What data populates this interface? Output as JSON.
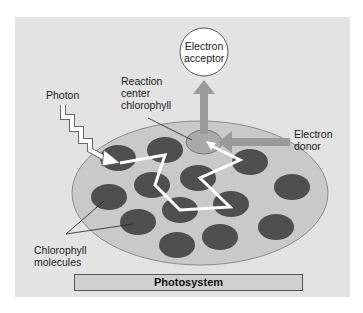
{
  "diagram": {
    "title": "Photosystem",
    "labels": {
      "electron_acceptor": [
        "Electron",
        "acceptor"
      ],
      "reaction_center": [
        "Reaction",
        "center",
        "chlorophyll"
      ],
      "photon": "Photon",
      "electron_donor": [
        "Electron",
        "donor"
      ],
      "chlorophyll_molecules": [
        "Chlorophyll",
        "molecules"
      ]
    },
    "colors": {
      "background_panel": "#e3e3e3",
      "photosystem_disc": "#c9c9c9",
      "chlorophyll": "#4f4f4f",
      "reaction_center": "#a9a9a9",
      "arrow": "#9a9a9a",
      "energy_path": "#ffffff"
    }
  }
}
